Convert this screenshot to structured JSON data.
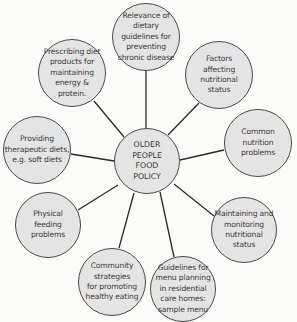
{
  "diagram": {
    "type": "hub-and-spoke",
    "colors": {
      "node_fill": "#e4e4e4",
      "node_border": "#4a4a4a",
      "connector": "#2a2a2a",
      "text": "#3a3a3a",
      "background": "#fbfbfa"
    },
    "hub": {
      "label": "OLDER\nPEOPLE\nFOOD\nPOLICY"
    },
    "nodes": [
      {
        "label": "Relevance of\ndietary\nguidelines for\npreventing\nchronic disease"
      },
      {
        "label": "Factors\naffecting\nnutritional\nstatus"
      },
      {
        "label": "Common\nnutrition\nproblems"
      },
      {
        "label": "Maintaining and\nmonitoring\nnutritional\nstatus"
      },
      {
        "label": "Guidelines for\nmenu planning\nin residential\ncare homes:\nsample menu"
      },
      {
        "label": "Community\nstrategies\nfor promoting\nhealthy eating"
      },
      {
        "label": "Physical\nfeeding\nproblems"
      },
      {
        "label": "Providing\ntherapeutic diets,\ne.g. soft diets"
      },
      {
        "label": "Prescribing diet\nproducts for\nmaintaining\nenergy &\nprotein."
      }
    ]
  }
}
